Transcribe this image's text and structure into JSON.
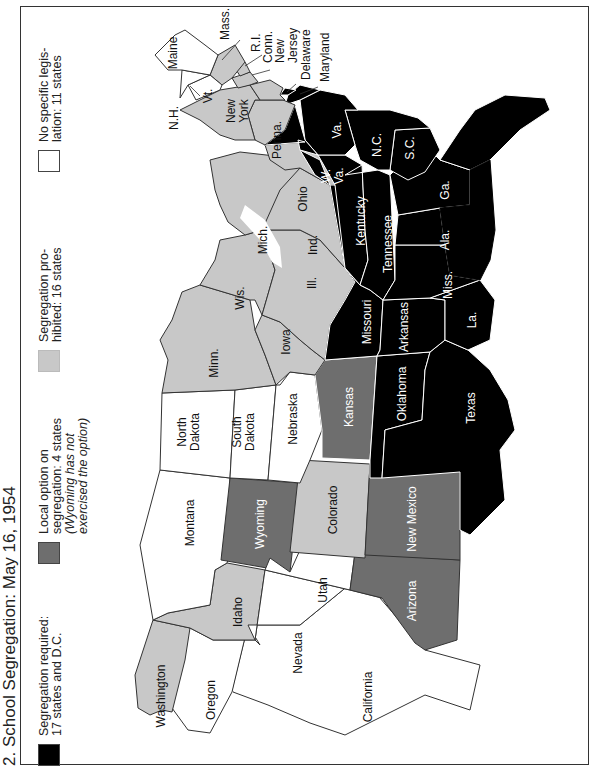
{
  "title": "2. School Segregation: May 16, 1954",
  "colors": {
    "required": "#000000",
    "local_option": "#6e6e6e",
    "prohibited": "#c8c8c8",
    "none": "#ffffff",
    "border_light": "#ffffff",
    "border_dark": "#333333"
  },
  "legend": [
    {
      "category": "required",
      "line1": "Segregation required:",
      "line2": "17 states and D.C.",
      "line3": "",
      "line4": ""
    },
    {
      "category": "local_option",
      "line1": "Local option on",
      "line2": "segregation: 4 states",
      "line3": "(Wyoming has not",
      "line4": "exercised the option)"
    },
    {
      "category": "prohibited",
      "line1": "Segregation pro-",
      "line2": "hibited: 16 states",
      "line3": "",
      "line4": ""
    },
    {
      "category": "none",
      "line1": "No specific legis-",
      "line2": "lation: 11 states",
      "line3": "",
      "line4": ""
    }
  ],
  "states": {
    "washington": {
      "label": "Washington",
      "category": "prohibited"
    },
    "oregon": {
      "label": "Oregon",
      "category": "none"
    },
    "california": {
      "label": "California",
      "category": "none"
    },
    "idaho": {
      "label": "Idaho",
      "category": "prohibited"
    },
    "nevada": {
      "label": "Nevada",
      "category": "none"
    },
    "montana": {
      "label": "Montana",
      "category": "none"
    },
    "wyoming": {
      "label": "Wyoming",
      "category": "local_option"
    },
    "utah": {
      "label": "Utah",
      "category": "none"
    },
    "arizona": {
      "label": "Arizona",
      "category": "local_option"
    },
    "colorado": {
      "label": "Colorado",
      "category": "prohibited"
    },
    "new_mexico": {
      "label": "New Mexico",
      "category": "local_option"
    },
    "north_dakota": {
      "label_1": "North",
      "label_2": "Dakota",
      "category": "none"
    },
    "south_dakota": {
      "label_1": "South",
      "label_2": "Dakota",
      "category": "none"
    },
    "nebraska": {
      "label": "Nebraska",
      "category": "none"
    },
    "kansas": {
      "label": "Kansas",
      "category": "local_option"
    },
    "oklahoma": {
      "label": "Oklahoma",
      "category": "required"
    },
    "texas": {
      "label": "Texas",
      "category": "required"
    },
    "minnesota": {
      "label": "Minn.",
      "category": "prohibited"
    },
    "iowa": {
      "label": "Iowa",
      "category": "prohibited"
    },
    "missouri": {
      "label": "Missouri",
      "category": "required"
    },
    "arkansas": {
      "label": "Arkansas",
      "category": "required"
    },
    "louisiana": {
      "label": "La.",
      "category": "required"
    },
    "wisconsin": {
      "label": "Wis.",
      "category": "prohibited"
    },
    "illinois": {
      "label": "Ill.",
      "category": "prohibited"
    },
    "michigan": {
      "label": "Mich.",
      "category": "prohibited"
    },
    "indiana": {
      "label": "Ind.",
      "category": "prohibited"
    },
    "ohio": {
      "label": "Ohio",
      "category": "prohibited"
    },
    "kentucky": {
      "label": "Kentucky",
      "category": "required"
    },
    "tennessee": {
      "label": "Tennessee",
      "category": "required"
    },
    "mississippi": {
      "label": "Miss.",
      "category": "required"
    },
    "alabama": {
      "label": "Ala.",
      "category": "required"
    },
    "georgia": {
      "label": "Ga.",
      "category": "required"
    },
    "florida": {
      "label": "Fla.",
      "category": "required"
    },
    "south_carolina": {
      "label": "S.C.",
      "category": "required"
    },
    "north_carolina": {
      "label": "N.C.",
      "category": "required"
    },
    "virginia": {
      "label": "Va.",
      "category": "required"
    },
    "west_virginia": {
      "label_1": "W.",
      "label_2": "Va.",
      "category": "required"
    },
    "maryland": {
      "label": "Maryland",
      "category": "required"
    },
    "delaware": {
      "label": "Delaware",
      "category": "required"
    },
    "pennsylvania": {
      "label": "Penna.",
      "category": "prohibited"
    },
    "new_york": {
      "label_1": "New",
      "label_2": "York",
      "category": "prohibited"
    },
    "new_jersey": {
      "label_1": "New",
      "label_2": "Jersey",
      "category": "prohibited"
    },
    "connecticut": {
      "label": "Conn.",
      "category": "prohibited"
    },
    "rhode_island": {
      "label": "R.I.",
      "category": "prohibited"
    },
    "massachusetts": {
      "label": "Mass.",
      "category": "prohibited"
    },
    "vermont": {
      "label": "Vt.",
      "category": "none"
    },
    "new_hampshire": {
      "label": "N.H.",
      "category": "none"
    },
    "maine": {
      "label": "Maine",
      "category": "none"
    }
  }
}
